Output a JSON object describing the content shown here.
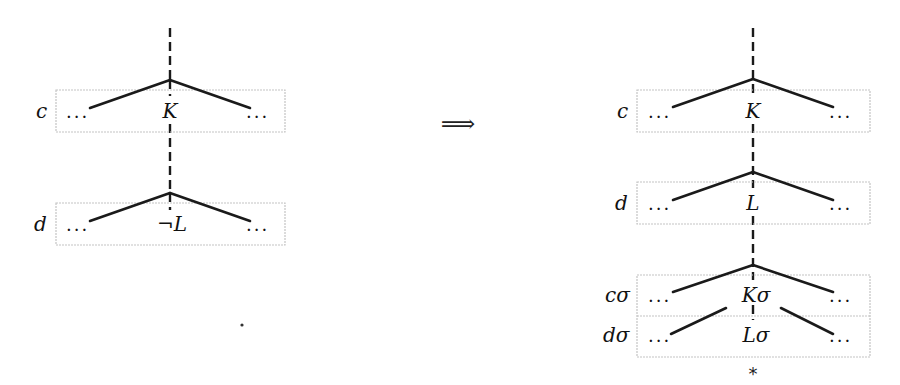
{
  "diagram": {
    "left": {
      "clauses": [
        {
          "label": "c",
          "literal": "K",
          "left_dots": "...",
          "right_dots": "..."
        },
        {
          "label": "d",
          "literal": "¬L",
          "left_dots": "...",
          "right_dots": "..."
        }
      ]
    },
    "arrow": "⟹",
    "right": {
      "clauses": [
        {
          "label": "c",
          "literal": "K",
          "left_dots": "...",
          "right_dots": "..."
        },
        {
          "label": "d",
          "literal": "L",
          "left_dots": "...",
          "right_dots": "..."
        },
        {
          "label": "cσ",
          "literal": "Kσ",
          "left_dots": "...",
          "right_dots": "..."
        },
        {
          "label": "dσ",
          "literal": "Lσ",
          "left_dots": "...",
          "right_dots": "..."
        }
      ],
      "closed_marker": "*"
    },
    "colors": {
      "edge": "#1a1a1a",
      "box_border": "#c4c4c4",
      "background": "#ffffff"
    }
  }
}
